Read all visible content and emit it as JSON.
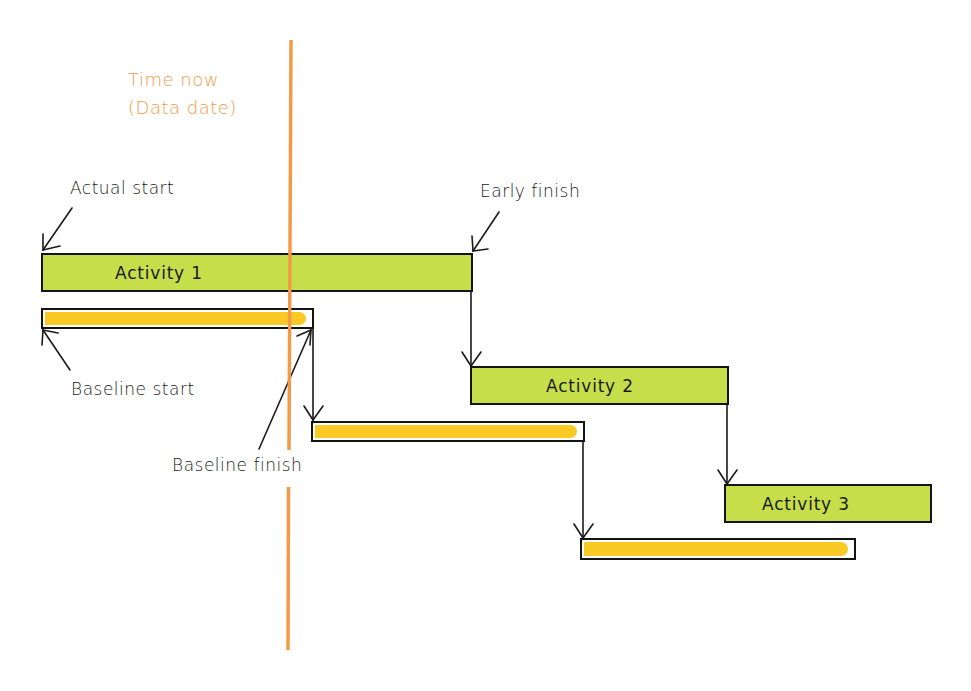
{
  "diagram": {
    "type": "gantt-baseline-comparison",
    "data_date": {
      "label_line1": "Time now",
      "label_line2": "(Data date)",
      "color": "#F29A48"
    },
    "activities": [
      {
        "name": "Activity 1",
        "color": "#C6DE4A"
      },
      {
        "name": "Activity 2",
        "color": "#C6DE4A"
      },
      {
        "name": "Activity 3",
        "color": "#C6DE4A"
      }
    ],
    "baseline_color": "#F9C924",
    "annotations": {
      "actual_start": "Actual start",
      "early_finish": "Early finish",
      "baseline_start": "Baseline start",
      "baseline_finish": "Baseline finish"
    }
  }
}
